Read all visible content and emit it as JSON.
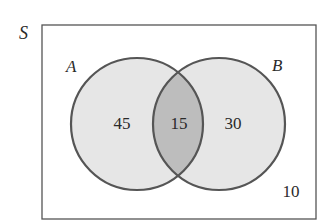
{
  "diagram": {
    "type": "venn",
    "universe_label": "S",
    "sets": [
      {
        "label": "A",
        "only_value": "45"
      },
      {
        "label": "B",
        "only_value": "30"
      }
    ],
    "intersection_value": "15",
    "outside_value": "10"
  },
  "colors": {
    "background": "#ffffff",
    "circle_fill": "#e6e6e6",
    "intersection_fill": "#bdbdbd",
    "stroke": "#555555",
    "text": "#2a2a2a"
  }
}
